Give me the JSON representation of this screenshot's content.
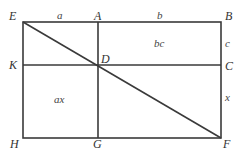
{
  "diagram": {
    "title": "",
    "points": {
      "E": "E",
      "A": "A",
      "B": "B",
      "K": "K",
      "D": "D",
      "C": "C",
      "H": "H",
      "G": "G",
      "F": "F"
    },
    "segment_labels": {
      "EA": "a",
      "AB": "b",
      "BC": "c",
      "CF": "x"
    },
    "region_labels": {
      "ABCD": "bc",
      "KDGH": "ax"
    },
    "colors": {
      "line": "#3a3a3a",
      "text": "#333333"
    }
  }
}
